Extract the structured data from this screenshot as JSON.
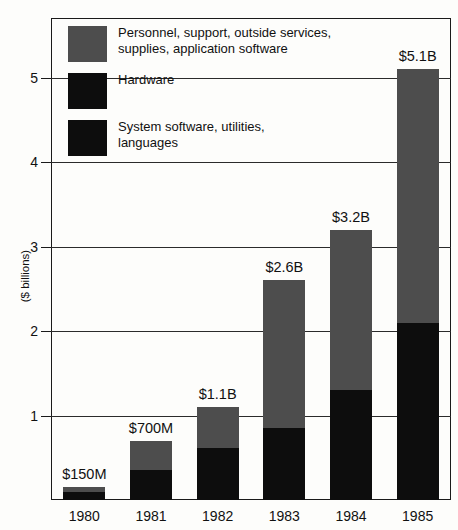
{
  "chart_data": {
    "type": "bar",
    "subtype": "stacked-bar",
    "title": "",
    "xlabel": "",
    "ylabel": "($ billions)",
    "categories": [
      "1980",
      "1981",
      "1982",
      "1983",
      "1984",
      "1985"
    ],
    "ylim": [
      0,
      5.6
    ],
    "yticks": [
      1,
      2,
      3,
      4,
      5
    ],
    "ytick_labels": [
      "1",
      "2",
      "3",
      "4",
      "5"
    ],
    "grid": true,
    "grid_axis": "y",
    "legend_position": "upper-left-inside",
    "series": [
      {
        "name": "Personnel, support, outside services,\nsupplies, application software",
        "color": "#4d4d4d",
        "values": [
          0.06,
          0.35,
          0.48,
          1.75,
          1.9,
          3.0
        ]
      },
      {
        "name": "Hardware",
        "color": "#0d0d0d",
        "values": [
          0.06,
          0.22,
          0.4,
          0.6,
          0.9,
          1.4
        ]
      },
      {
        "name": "System software, utilities,\nlanguages",
        "color": "#0d0d0d",
        "values": [
          0.03,
          0.13,
          0.22,
          0.25,
          0.4,
          0.7
        ]
      }
    ],
    "totals": [
      0.15,
      0.7,
      1.1,
      2.6,
      3.2,
      5.1
    ],
    "data_labels": [
      "$150M",
      "$700M",
      "$1.1B",
      "$2.6B",
      "$3.2B",
      "$5.1B"
    ],
    "segment_split_values": [
      0.09,
      0.35,
      0.62,
      0.85,
      1.3,
      2.1
    ],
    "annotations": []
  },
  "legend": {
    "items": [
      {
        "label": "Personnel, support, outside services,\nsupplies, application software",
        "swatch": "personnel"
      },
      {
        "label": "Hardware",
        "swatch": "hardware"
      },
      {
        "label": "System software, utilities,\nlanguages",
        "swatch": "system"
      }
    ]
  },
  "axis": {
    "y_title": "($ billions)"
  }
}
